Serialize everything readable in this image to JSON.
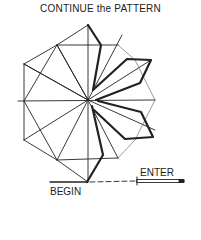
{
  "title": "CONTINUE the PATTERN",
  "labels": {
    "enter": "ENTER",
    "begin": "BEGIN"
  },
  "colors": {
    "line": "#222222",
    "background": "#ffffff"
  }
}
